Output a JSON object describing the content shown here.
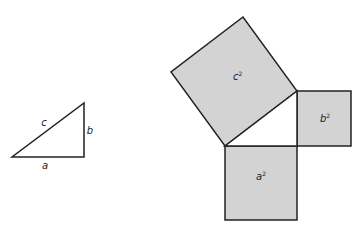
{
  "colors": {
    "stroke": "#222222",
    "fill": "#d3d3d3",
    "background": "#ffffff"
  },
  "triangle": {
    "labels": {
      "a": "a",
      "b": "b",
      "c": "c"
    }
  },
  "squares": {
    "a": {
      "base": "a",
      "exp": "2"
    },
    "b": {
      "base": "b",
      "exp": "2"
    },
    "c": {
      "base": "c",
      "exp": "2"
    }
  }
}
